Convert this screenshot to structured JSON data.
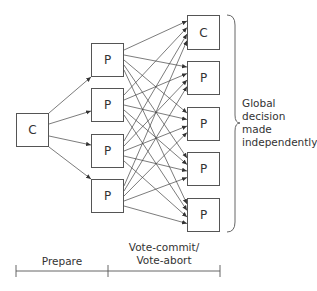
{
  "diagram": {
    "coordinator_left": {
      "label": "C"
    },
    "participants_mid": [
      {
        "label": "P"
      },
      {
        "label": "P"
      },
      {
        "label": "P"
      },
      {
        "label": "P"
      }
    ],
    "nodes_right": [
      {
        "label": "C"
      },
      {
        "label": "P"
      },
      {
        "label": "P"
      },
      {
        "label": "P"
      },
      {
        "label": "P"
      }
    ],
    "brace_annotation": [
      "Global",
      "decision",
      "made",
      "independently"
    ],
    "timeline": {
      "phase1": "Prepare",
      "phase2_line1": "Vote-commit/",
      "phase2_line2": "Vote-abort"
    },
    "colors": {
      "stroke": "#555555",
      "text": "#333333"
    }
  }
}
